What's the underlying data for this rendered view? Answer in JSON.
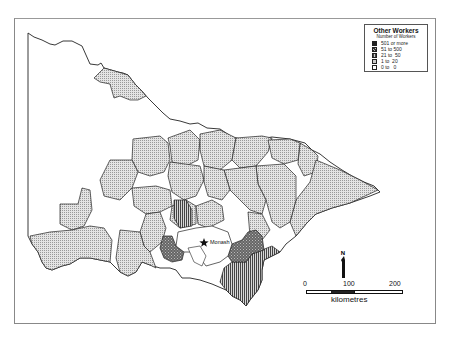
{
  "map": {
    "region": "Victoria, Australia",
    "city_marker": {
      "label": "Monash",
      "icon": "star-icon"
    }
  },
  "legend": {
    "title": "Other Workers",
    "subtitle": "Number of Workers",
    "items": [
      {
        "label": "501 or more",
        "pattern": "solid-dark",
        "color": "#222222"
      },
      {
        "label": "51 to 500",
        "pattern": "crosshatch",
        "color": "#555555"
      },
      {
        "label": "21 to  50",
        "pattern": "vertical-lines",
        "color": "#888888"
      },
      {
        "label": "1 to  20",
        "pattern": "light-dots",
        "color": "#cccccc"
      },
      {
        "label": "0 to   0",
        "pattern": "white",
        "color": "#ffffff"
      }
    ]
  },
  "north_arrow": {
    "label": "N"
  },
  "scale_bar": {
    "ticks": [
      "0",
      "100",
      "200"
    ],
    "unit": "kilometres"
  }
}
